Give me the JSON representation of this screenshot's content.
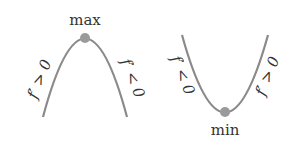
{
  "colors": {
    "curve": "#8a8a8a",
    "dot": "#9a9a9a",
    "text": "#333333",
    "background": "#ffffff"
  },
  "max_panel": {
    "label": "max",
    "left_slope_label": "f′ > 0",
    "right_slope_label": "f′ < 0"
  },
  "min_panel": {
    "label": "min",
    "left_slope_label": "f′ < 0",
    "right_slope_label": "f′ > 0"
  }
}
